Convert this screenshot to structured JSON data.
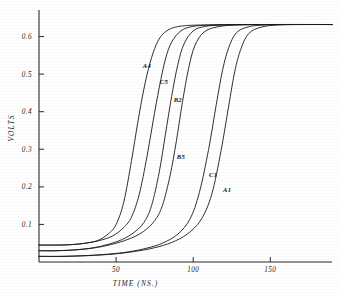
{
  "chart_data": {
    "type": "line",
    "title": "",
    "xlabel": "TIME  (NS.)",
    "ylabel": "VOLTS",
    "xlim": [
      0,
      190
    ],
    "ylim": [
      0,
      0.66
    ],
    "xticks": [
      50,
      100,
      150
    ],
    "xtick_labels": [
      "50",
      "100",
      "150"
    ],
    "yticks": [
      0.1,
      0.2,
      0.3,
      0.4,
      0.5,
      0.6
    ],
    "ytick_labels": [
      "0.1",
      "0.2",
      "0.3",
      "0.4",
      "0.5",
      "0.6"
    ],
    "grid": false,
    "legend_position": "inline-curve-labels",
    "plateau_value": 0.63,
    "line_color": "#1a1a1a",
    "background_color": "#ffffff",
    "series": [
      {
        "name": "A4",
        "label": "A4",
        "baseline": 0.045,
        "midpoint_time": 62,
        "plateau": 0.63,
        "label_x": 70,
        "label_y": 0.515,
        "x": [
          0,
          10,
          20,
          30,
          38,
          45,
          50,
          55,
          60,
          64,
          68,
          72,
          76,
          80,
          86,
          95,
          110,
          140,
          190
        ],
        "y": [
          0.045,
          0.045,
          0.046,
          0.05,
          0.057,
          0.075,
          0.1,
          0.16,
          0.27,
          0.37,
          0.46,
          0.53,
          0.578,
          0.605,
          0.622,
          0.629,
          0.631,
          0.632,
          0.632
        ]
      },
      {
        "name": "C5",
        "label": "C5",
        "baseline": 0.045,
        "midpoint_time": 71,
        "plateau": 0.63,
        "label_x": 81,
        "label_y": 0.475,
        "x": [
          0,
          10,
          20,
          30,
          40,
          48,
          55,
          60,
          65,
          70,
          74,
          78,
          82,
          86,
          92,
          100,
          115,
          145,
          190
        ],
        "y": [
          0.045,
          0.045,
          0.046,
          0.05,
          0.058,
          0.07,
          0.092,
          0.12,
          0.18,
          0.28,
          0.375,
          0.465,
          0.54,
          0.585,
          0.615,
          0.627,
          0.631,
          0.632,
          0.632
        ]
      },
      {
        "name": "B2",
        "label": "B2",
        "baseline": 0.03,
        "midpoint_time": 79,
        "plateau": 0.63,
        "label_x": 90,
        "label_y": 0.425,
        "x": [
          0,
          10,
          22,
          34,
          44,
          54,
          62,
          68,
          73,
          78,
          82,
          86,
          90,
          94,
          100,
          108,
          122,
          150,
          190
        ],
        "y": [
          0.03,
          0.03,
          0.032,
          0.037,
          0.046,
          0.06,
          0.08,
          0.105,
          0.15,
          0.24,
          0.34,
          0.44,
          0.525,
          0.58,
          0.615,
          0.627,
          0.631,
          0.632,
          0.632
        ]
      },
      {
        "name": "B5",
        "label": "B5",
        "baseline": 0.03,
        "midpoint_time": 86,
        "plateau": 0.63,
        "label_x": 92,
        "label_y": 0.275,
        "x": [
          0,
          12,
          26,
          38,
          50,
          60,
          68,
          75,
          80,
          85,
          89,
          93,
          97,
          101,
          107,
          116,
          130,
          158,
          190
        ],
        "y": [
          0.03,
          0.03,
          0.033,
          0.039,
          0.05,
          0.064,
          0.082,
          0.11,
          0.15,
          0.23,
          0.32,
          0.425,
          0.515,
          0.575,
          0.612,
          0.626,
          0.631,
          0.632,
          0.632
        ]
      },
      {
        "name": "C1",
        "label": "C1",
        "baseline": 0.015,
        "midpoint_time": 108,
        "plateau": 0.63,
        "label_x": 113,
        "label_y": 0.225,
        "x": [
          0,
          15,
          30,
          45,
          58,
          70,
          80,
          90,
          98,
          104,
          110,
          115,
          119,
          123,
          128,
          136,
          148,
          168,
          190
        ],
        "y": [
          0.015,
          0.015,
          0.017,
          0.021,
          0.027,
          0.037,
          0.05,
          0.074,
          0.115,
          0.185,
          0.3,
          0.42,
          0.51,
          0.57,
          0.61,
          0.626,
          0.631,
          0.632,
          0.632
        ]
      },
      {
        "name": "A1",
        "label": "A1",
        "baseline": 0.015,
        "midpoint_time": 115,
        "plateau": 0.63,
        "label_x": 122,
        "label_y": 0.185,
        "x": [
          0,
          15,
          32,
          48,
          62,
          75,
          86,
          96,
          105,
          112,
          118,
          123,
          127,
          131,
          136,
          144,
          156,
          174,
          190
        ],
        "y": [
          0.015,
          0.015,
          0.017,
          0.021,
          0.028,
          0.038,
          0.052,
          0.074,
          0.112,
          0.18,
          0.295,
          0.415,
          0.508,
          0.568,
          0.608,
          0.625,
          0.631,
          0.632,
          0.632
        ]
      }
    ]
  }
}
